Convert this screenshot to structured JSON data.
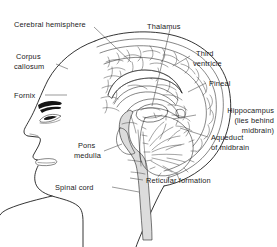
{
  "figure": {
    "type": "anatomical-line-diagram",
    "background_color": "#ffffff",
    "line_color": "#111111",
    "text_color": "#1a1a1a",
    "brainstem_fill": "#dcdcdc"
  },
  "labels": [
    {
      "id": "cerebral-hemisphere",
      "text": "Cerebral hemisphere",
      "side": "left",
      "x": 14,
      "y": 24
    },
    {
      "id": "thalamus",
      "text": "Thalamus",
      "side": "left",
      "x": 147,
      "y": 26
    },
    {
      "id": "corpus-callosum-1",
      "text": "Corpus",
      "side": "left",
      "x": 16,
      "y": 56
    },
    {
      "id": "corpus-callosum-2",
      "text": "callosum",
      "side": "left",
      "x": 14,
      "y": 66
    },
    {
      "id": "third-ventricle-1",
      "text": "Third",
      "side": "left",
      "x": 196,
      "y": 53
    },
    {
      "id": "third-ventricle-2",
      "text": "ventricle",
      "side": "left",
      "x": 193,
      "y": 63
    },
    {
      "id": "pineal",
      "text": "Pineal",
      "side": "left",
      "x": 209,
      "y": 85
    },
    {
      "id": "fornix",
      "text": "Fornix",
      "side": "left",
      "x": 14,
      "y": 97
    },
    {
      "id": "hippocampus-1",
      "text": "Hippocampus",
      "side": "right",
      "x": 272,
      "y": 110
    },
    {
      "id": "hippocampus-2",
      "text": "(lies  behind",
      "side": "right",
      "x": 272,
      "y": 120
    },
    {
      "id": "hippocampus-3",
      "text": "midbrain)",
      "side": "right",
      "x": 272,
      "y": 130
    },
    {
      "id": "aqueduct-1",
      "text": "Aqueduct",
      "side": "left",
      "x": 211,
      "y": 139
    },
    {
      "id": "aqueduct-2",
      "text": "of  midbrain",
      "side": "left",
      "x": 211,
      "y": 149
    },
    {
      "id": "pons-1",
      "text": "Pons",
      "side": "left",
      "x": 78,
      "y": 146
    },
    {
      "id": "pons-2",
      "text": "medulla",
      "side": "left",
      "x": 74,
      "y": 156
    },
    {
      "id": "reticular-formation",
      "text": "Reticular formation",
      "side": "left",
      "x": 146,
      "y": 182
    },
    {
      "id": "spinal-cord",
      "text": "Spinal cord",
      "side": "left",
      "x": 75,
      "y": 189
    }
  ],
  "structures": [
    "head-profile",
    "skull-outline",
    "cerebral-cortex",
    "corpus-callosum-band",
    "fornix-arc",
    "lateral-ventricle",
    "thalamus-body",
    "third-ventricle-space",
    "pineal-body",
    "midbrain",
    "pons",
    "medulla",
    "cerebellum",
    "spinal-cord-column",
    "reticular-formation-core",
    "eye",
    "eyebrow",
    "nose",
    "lips",
    "chin",
    "jaw-line",
    "neck-line"
  ]
}
